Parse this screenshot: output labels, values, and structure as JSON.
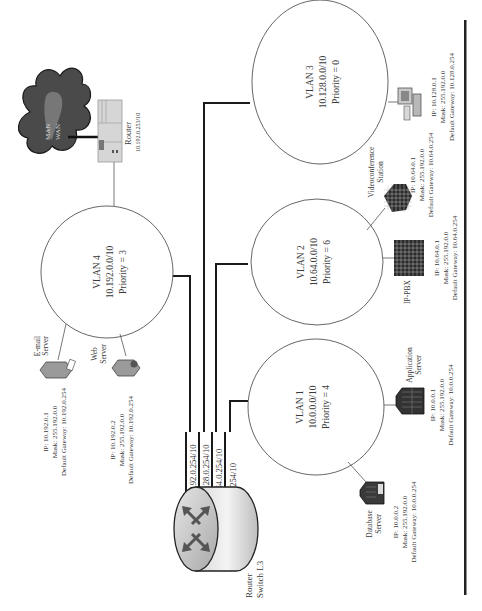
{
  "diagram": {
    "orientation": "rotated-90-ccw",
    "vlans": [
      {
        "id": "vlan1",
        "name": "VLAN 1",
        "subnet": "10.0.0.0/10",
        "priority": "Priority = 4"
      },
      {
        "id": "vlan2",
        "name": "VLAN 2",
        "subnet": "10.64.0.0/10",
        "priority": "Priority = 6"
      },
      {
        "id": "vlan3",
        "name": "VLAN 3",
        "subnet": "10.128.0.0/10",
        "priority": "Priority = 0"
      },
      {
        "id": "vlan4",
        "name": "VLAN 4",
        "subnet": "10.192.0.0/10",
        "priority": "Priority = 3"
      }
    ],
    "core": {
      "label_line1": "Router",
      "label_line2": "Switch L3",
      "ports": [
        "10.192.0.254/10",
        "10.128.0.254/10",
        "10.64.0.254/10",
        "10.0.0.254/10"
      ]
    },
    "edge_router": {
      "label": "Router",
      "ip": "10.192.0.253/10"
    },
    "cloud": {
      "line1": "MAN",
      "line2": "WAN"
    },
    "devices": [
      {
        "id": "email",
        "vlan": "vlan4",
        "name_line1": "E-mail",
        "name_line2": "Server",
        "ip": "IP: 10.192.0.1",
        "mask": "Mask: 255.192.0.0",
        "gateway": "Default Gateway: 10.192.0.254"
      },
      {
        "id": "web",
        "vlan": "vlan4",
        "name_line1": "Web",
        "name_line2": "Server",
        "ip": "IP: 10.192.0.2",
        "mask": "Mask: 255.192.0.0",
        "gateway": "Default Gateway: 10.192.0.254"
      },
      {
        "id": "database",
        "vlan": "vlan1",
        "name_line1": "Database",
        "name_line2": "Server",
        "ip": "IP: 10.0.0.2",
        "mask": "Mask: 255.192.0.0",
        "gateway": "Default Gateway: 10.0.0.254"
      },
      {
        "id": "application",
        "vlan": "vlan1",
        "name_line1": "Application",
        "name_line2": "Server",
        "ip": "IP: 10.0.0.1",
        "mask": "Mask: 255.192.0.0",
        "gateway": "Default Gateway: 10.0.0.254"
      },
      {
        "id": "ippbx",
        "vlan": "vlan2",
        "name_line1": "IP-PBX",
        "name_line2": "",
        "ip": "IP: 10.64.0.1",
        "mask": "Mask: 255.192.0.0",
        "gateway": "Default Gateway: 10.64.0.254"
      },
      {
        "id": "videoconf",
        "vlan": "vlan2",
        "name_line1": "Videoconference",
        "name_line2": "Station",
        "ip": "IP: 10.64.0.1",
        "mask": "Mask: 255.192.0.0",
        "gateway": "Default Gateway: 10.64.0.254"
      },
      {
        "id": "pc",
        "vlan": "vlan3",
        "name_line1": "",
        "name_line2": "",
        "ip": "IP: 10.128.0.1",
        "mask": "Mask: 255.192.0.0",
        "gateway": "Default Gateway: 10.128.0.254"
      }
    ]
  }
}
